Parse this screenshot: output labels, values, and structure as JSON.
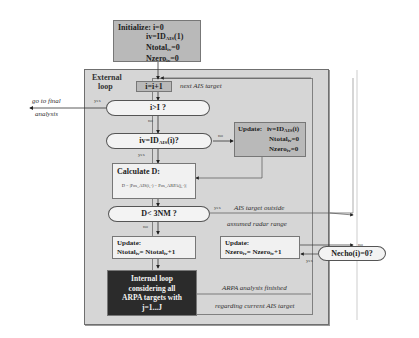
{
  "diagram": {
    "init_box": {
      "title": "Initialize: i=0",
      "lines": [
        "iv=ID",
        "AIS",
        "(1)",
        "Ntotal",
        "ir",
        "=0",
        "Nzero",
        "ir",
        "=0"
      ]
    },
    "init_line_1_pre": "iv=ID",
    "init_line_1_sub": "AIS",
    "init_line_1_post": "(1)",
    "init_line_2_pre": "Ntotal",
    "init_line_2_sub": "iv",
    "init_line_2_post": "=0",
    "init_line_3_pre": "Nzero",
    "init_line_3_sub": "iv",
    "init_line_3_post": "=0",
    "external_loop_label_1": "External",
    "external_loop_label_2": "loop",
    "increment_box": "i=i+1",
    "next_ais_note": "next AIS target",
    "decision_i_gt_I": "i>I ?",
    "yes_label_1": "yes",
    "no_label_1": "no",
    "go_final_1": "go to final",
    "go_final_2": "analysis",
    "decision_iv_pre": "iv=ID",
    "decision_iv_sub": "AIS",
    "decision_iv_post": "(i)?",
    "no_label_2": "no",
    "yes_label_2": "yes",
    "update_iv": {
      "title": "Update:",
      "line1_pre": "iv=ID",
      "line1_sub": "AIS",
      "line1_post": "(i)",
      "line2_pre": "Ntotal",
      "line2_sub": "iv",
      "line2_post": "=0",
      "line3_pre": "Nzero",
      "line3_sub": "iv",
      "line3_post": "=0"
    },
    "calc_box": {
      "title": "Calculate D:",
      "formula": "D = |Pos_AIS(i,·) − Pos_ARPA(j,·)|"
    },
    "decision_d": "D< 3NM ?",
    "yes_label_3": "yes",
    "no_label_3": "no",
    "ais_outside_1": "AIS target outside",
    "ais_outside_2": "assumed radar range",
    "update_total": {
      "title": "Update:",
      "line_pre": "Ntotal",
      "line_sub": "iv",
      "line_mid": "= Ntotal",
      "line_sub2": "iv",
      "line_post": "+1"
    },
    "update_zero": {
      "title": "Update:",
      "line_pre": "Nzero",
      "line_sub": "iv",
      "line_mid": "= Nzero",
      "line_sub2": "iv",
      "line_post": "+1"
    },
    "decision_necho": "Necho(i)=0?",
    "no_label_4": "no",
    "yes_label_4": "yes",
    "internal_loop": [
      "Internal loop",
      "considering all",
      "ARPA targets with",
      "j=1...J"
    ],
    "arpa_finished_1": "ARPA analysis finished",
    "arpa_finished_2": "regarding current AIS target",
    "colors": {
      "frame_bg": "#d6d6d6",
      "gray_box": "#b9b9b9",
      "light_box": "#f1f1f1",
      "dark_box": "#2b2b2b"
    }
  }
}
